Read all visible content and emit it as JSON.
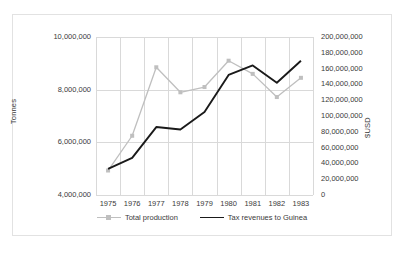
{
  "chart_data": {
    "type": "line",
    "title": "",
    "xlabel": "",
    "categories": [
      "1975",
      "1976",
      "1977",
      "1978",
      "1979",
      "1980",
      "1981",
      "1982",
      "1983"
    ],
    "grid": true,
    "legend_position": "bottom",
    "axes": {
      "left": {
        "label": "Tonnes",
        "ticks": [
          "4,000,000",
          "6,000,000",
          "8,000,000",
          "10,000,000"
        ],
        "tick_values": [
          4000000,
          6000000,
          8000000,
          10000000
        ],
        "min": 4000000,
        "max": 10000000
      },
      "right": {
        "label": "$USD",
        "ticks": [
          "0",
          "20,000,000",
          "40,000,000",
          "60,000,000",
          "80,000,000",
          "100,000,000",
          "120,000,000",
          "140,000,000",
          "160,000,000",
          "180,000,000",
          "200,000,000"
        ],
        "tick_values": [
          0,
          20000000,
          40000000,
          60000000,
          80000000,
          100000000,
          120000000,
          140000000,
          160000000,
          180000000,
          200000000
        ],
        "min": 0,
        "max": 200000000
      }
    },
    "series": [
      {
        "name": "Total production",
        "axis": "left",
        "color": "#bfbfbf",
        "marker": "square",
        "values": [
          4930000,
          6250000,
          8850000,
          7900000,
          8100000,
          9100000,
          8600000,
          7720000,
          8450000
        ]
      },
      {
        "name": "Tax revenues to Guinea",
        "axis": "right",
        "color": "#1a1a1a",
        "marker": "none",
        "values": [
          33000000,
          47000000,
          86000000,
          83000000,
          105000000,
          152000000,
          164000000,
          142000000,
          170000000
        ]
      }
    ]
  },
  "legend": {
    "entries": [
      {
        "label": "Total production"
      },
      {
        "label": "Tax revenues to Guinea"
      }
    ]
  }
}
